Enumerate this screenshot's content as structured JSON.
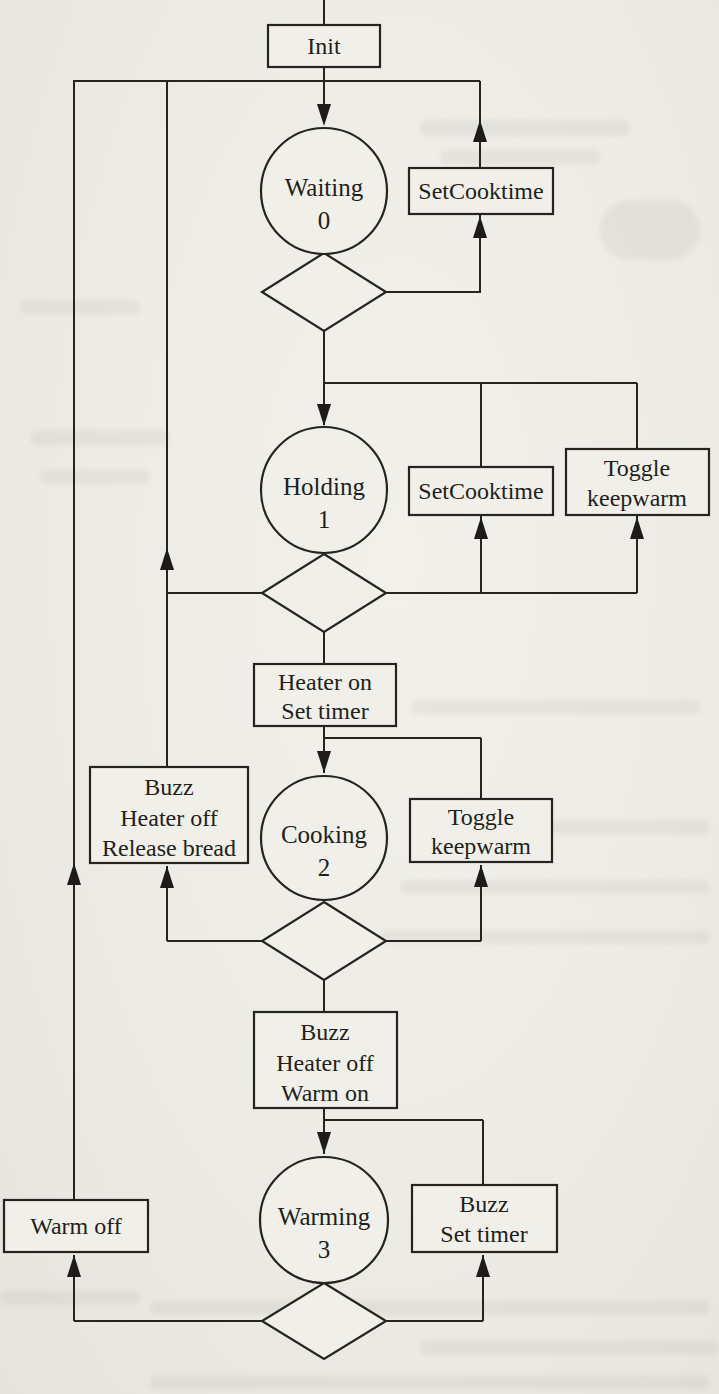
{
  "page": {
    "paper_color": "#edebe6",
    "ink_color": "#25241f"
  },
  "diagram": {
    "type": "state-machine-flowchart",
    "states": [
      {
        "name": "Waiting",
        "number": "0"
      },
      {
        "name": "Holding",
        "number": "1"
      },
      {
        "name": "Cooking",
        "number": "2"
      },
      {
        "name": "Warming",
        "number": "3"
      }
    ],
    "boxes": {
      "init": {
        "lines": [
          "Init"
        ]
      },
      "set_cooktime_1": {
        "lines": [
          "SetCooktime"
        ]
      },
      "set_cooktime_2": {
        "lines": [
          "SetCooktime"
        ]
      },
      "toggle_keepwarm_1": {
        "lines": [
          "Toggle",
          "keepwarm"
        ]
      },
      "heater_on": {
        "lines": [
          "Heater on",
          "Set timer"
        ]
      },
      "buzz_release": {
        "lines": [
          "Buzz",
          "Heater off",
          "Release bread"
        ]
      },
      "toggle_keepwarm_2": {
        "lines": [
          "Toggle",
          "keepwarm"
        ]
      },
      "buzz_warm_on": {
        "lines": [
          "Buzz",
          "Heater off",
          "Warm on"
        ]
      },
      "warm_off": {
        "lines": [
          "Warm off"
        ]
      },
      "buzz_set_timer": {
        "lines": [
          "Buzz",
          "Set timer"
        ]
      }
    }
  }
}
